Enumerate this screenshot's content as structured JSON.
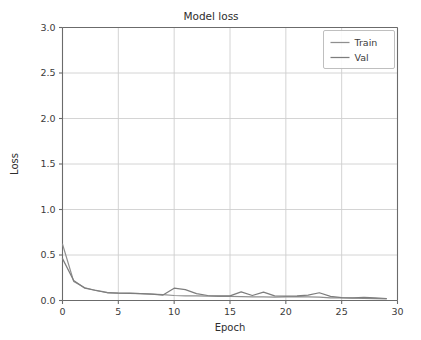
{
  "chart_data": {
    "type": "line",
    "title": "Model loss",
    "xlabel": "Epoch",
    "ylabel": "Loss",
    "xlim": [
      0,
      30
    ],
    "ylim": [
      0.0,
      3.0
    ],
    "xticks": [
      0,
      5,
      10,
      15,
      20,
      25,
      30
    ],
    "xtick_labels": [
      "0",
      "5",
      "10",
      "15",
      "20",
      "25",
      "30"
    ],
    "yticks": [
      0.0,
      0.5,
      1.0,
      1.5,
      2.0,
      2.5,
      3.0
    ],
    "ytick_labels": [
      "0.0",
      "0.5",
      "1.0",
      "1.5",
      "2.0",
      "2.5",
      "3.0"
    ],
    "grid": true,
    "legend_position": "upper right",
    "x": [
      0,
      1,
      2,
      3,
      4,
      5,
      6,
      7,
      8,
      9,
      10,
      11,
      12,
      13,
      14,
      15,
      16,
      17,
      18,
      19,
      20,
      21,
      22,
      23,
      24,
      25,
      26,
      27,
      28,
      29
    ],
    "series": [
      {
        "name": "Train",
        "color": "#8f8f8f",
        "values": [
          0.62,
          0.21,
          0.14,
          0.11,
          0.09,
          0.08,
          0.08,
          0.075,
          0.07,
          0.065,
          0.055,
          0.05,
          0.05,
          0.048,
          0.045,
          0.045,
          0.042,
          0.04,
          0.04,
          0.038,
          0.04,
          0.042,
          0.04,
          0.038,
          0.03,
          0.028,
          0.025,
          0.022,
          0.02,
          0.018
        ]
      },
      {
        "name": "Val",
        "color": "#7d7d7d",
        "values": [
          0.46,
          0.22,
          0.135,
          0.11,
          0.085,
          0.08,
          0.078,
          0.075,
          0.07,
          0.06,
          0.135,
          0.12,
          0.075,
          0.055,
          0.05,
          0.05,
          0.095,
          0.055,
          0.092,
          0.05,
          0.048,
          0.05,
          0.06,
          0.085,
          0.045,
          0.032,
          0.028,
          0.035,
          0.028,
          0.022
        ]
      }
    ],
    "legend_entries": [
      {
        "label": "Train",
        "color": "#8f8f8f"
      },
      {
        "label": "Val",
        "color": "#7d7d7d"
      }
    ]
  }
}
